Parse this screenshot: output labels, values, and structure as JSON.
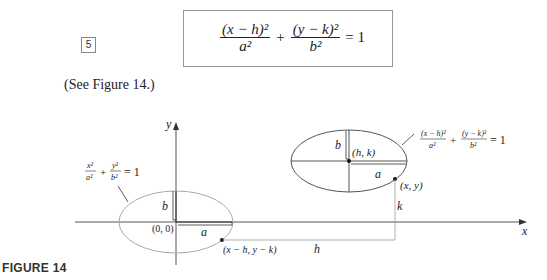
{
  "equation": {
    "number": "5",
    "term1_num": "(x − h)²",
    "term1_den": "a²",
    "plus": "+",
    "term2_num": "(y − k)²",
    "term2_den": "b²",
    "rhs": "= 1"
  },
  "see_text": "(See Figure 14.)",
  "figure": {
    "label": "FIGURE 14",
    "axes": {
      "x_label": "x",
      "y_label": "y"
    },
    "origin_ellipse": {
      "eq_num1": "x²",
      "eq_den1": "a²",
      "eq_num2": "y²",
      "eq_den2": "b²",
      "eq_rhs": "= 1",
      "center_label": "(0, 0)",
      "a_label": "a",
      "b_label": "b",
      "point_label": "(x − h, y − k)"
    },
    "shifted_ellipse": {
      "eq_num1": "(x − h)²",
      "eq_den1": "a²",
      "eq_num2": "(y − k)²",
      "eq_den2": "b²",
      "eq_rhs": "= 1",
      "center_label": "(h, k)",
      "a_label": "a",
      "b_label": "b",
      "point_label": "(x, y)"
    },
    "h_label": "h",
    "k_label": "k"
  }
}
